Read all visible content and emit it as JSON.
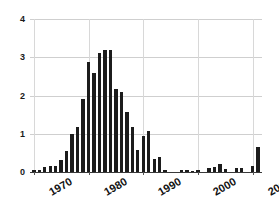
{
  "chart_data": {
    "type": "bar",
    "title": "",
    "subtitle": "",
    "xlabel": "",
    "ylabel": "",
    "grid": true,
    "legend": null,
    "xlim": [
      1969.3,
      2011.7
    ],
    "ylim": [
      0,
      4
    ],
    "y_ticks": [
      0,
      1,
      2,
      3,
      4
    ],
    "y_tick_labels": [
      "0",
      "1",
      "2",
      "3",
      "4"
    ],
    "x_ticks": [
      1970,
      1980,
      1990,
      2000,
      2010
    ],
    "x_tick_labels": [
      "1970",
      "1980",
      "1990",
      "2000",
      "2010"
    ],
    "bar_color": "#1c1c1c",
    "grid_color": "#cfcfcf",
    "categories": [
      1970,
      1971,
      1972,
      1973,
      1974,
      1975,
      1976,
      1977,
      1978,
      1979,
      1980,
      1981,
      1982,
      1983,
      1984,
      1985,
      1986,
      1987,
      1988,
      1989,
      1990,
      1991,
      1992,
      1993,
      1994,
      1995,
      1996,
      1997,
      1998,
      1999,
      2000,
      2001,
      2002,
      2003,
      2004,
      2005,
      2006,
      2007,
      2008,
      2009,
      2010,
      2011
    ],
    "values": [
      0.05,
      0.04,
      0.13,
      0.15,
      0.16,
      0.31,
      0.54,
      1.0,
      1.18,
      1.9,
      2.87,
      2.58,
      3.1,
      3.18,
      3.18,
      2.17,
      2.08,
      1.58,
      1.17,
      0.58,
      0.93,
      1.07,
      0.35,
      0.39,
      0.05,
      0.0,
      0.0,
      0.04,
      0.05,
      0.02,
      0.04,
      0.0,
      0.1,
      0.12,
      0.2,
      0.07,
      0.0,
      0.1,
      0.1,
      0.0,
      0.16,
      0.66
    ]
  }
}
